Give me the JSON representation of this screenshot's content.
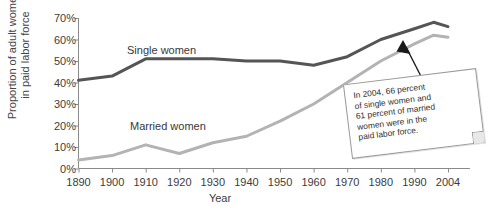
{
  "chart_data": {
    "type": "line",
    "title": "",
    "xlabel": "Year",
    "ylabel": "Proportion of adult women in paid labor force",
    "ylabel_line1": "Proportion of adult women",
    "ylabel_line2": "in paid labor force",
    "grid": false,
    "legend_position": "inline-labels",
    "xlim": [
      1890,
      2004
    ],
    "ylim": [
      0,
      70
    ],
    "xticks": [
      1890,
      1900,
      1910,
      1920,
      1930,
      1940,
      1950,
      1960,
      1970,
      1980,
      1990,
      2004
    ],
    "xtick_labels": [
      "1890",
      "1900",
      "1910",
      "1920",
      "1930",
      "1940",
      "1950",
      "1960",
      "1970",
      "1980",
      "1990",
      "2004"
    ],
    "yticks": [
      0,
      10,
      20,
      30,
      40,
      50,
      60,
      70
    ],
    "ytick_labels": [
      "0%",
      "10%",
      "20%",
      "30%",
      "40%",
      "50%",
      "60%",
      "70%"
    ],
    "x": [
      1890,
      1900,
      1910,
      1920,
      1930,
      1940,
      1950,
      1960,
      1970,
      1980,
      1990,
      1998,
      2004
    ],
    "series": [
      {
        "name": "Single women",
        "label": "Single women",
        "color": "#555555",
        "values": [
          41,
          43,
          51,
          51,
          51,
          50,
          50,
          48,
          52,
          60,
          65,
          68,
          66
        ]
      },
      {
        "name": "Married women",
        "label": "Married women",
        "color": "#b3b3b3",
        "values": [
          4,
          6,
          11,
          7,
          12,
          15,
          22,
          30,
          40,
          50,
          58,
          62,
          61
        ]
      }
    ],
    "annotations": [
      {
        "name": "callout-2004",
        "lines": [
          "In 2004, 66 percent",
          "of single women and",
          "61 percent of married",
          "women were in the",
          "paid labor force."
        ],
        "points_to_series": "Married women",
        "points_to_x": 2004,
        "points_to_y": 61
      }
    ]
  },
  "axis_color": "#8a8a8a",
  "arrow_color": "#1a1a1a"
}
